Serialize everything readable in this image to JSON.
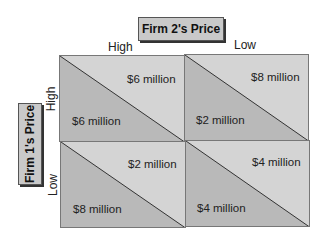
{
  "title_col": "Firm 2's Price",
  "title_row": "Firm 1's Price",
  "col_labels": [
    "High",
    "Low"
  ],
  "row_labels": [
    "High",
    "Low"
  ],
  "cells": [
    {
      "firm1": "$6 million",
      "firm2": "$6 million"
    },
    {
      "firm1": "$2 million",
      "firm2": "$8 million"
    },
    {
      "firm1": "$8 million",
      "firm2": "$2 million"
    },
    {
      "firm1": "$4 million",
      "firm2": "$4 million"
    }
  ],
  "colors": {
    "light": "#d4d4d4",
    "dark": "#b9b9b9",
    "border": "#777777"
  }
}
